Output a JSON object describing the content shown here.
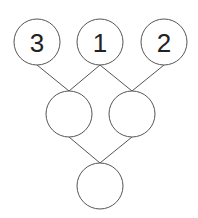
{
  "diagram": {
    "type": "tree",
    "nodes": [
      {
        "id": "top-left",
        "label": "3",
        "cx": 37,
        "cy": 42
      },
      {
        "id": "top-center",
        "label": "1",
        "cx": 100,
        "cy": 42
      },
      {
        "id": "top-right",
        "label": "2",
        "cx": 164,
        "cy": 42
      },
      {
        "id": "mid-left",
        "label": "",
        "cx": 69,
        "cy": 114
      },
      {
        "id": "mid-right",
        "label": "",
        "cx": 132,
        "cy": 114
      },
      {
        "id": "bottom",
        "label": "",
        "cx": 100,
        "cy": 186
      }
    ],
    "edges": [
      [
        "top-left",
        "mid-left"
      ],
      [
        "top-center",
        "mid-left"
      ],
      [
        "top-center",
        "mid-right"
      ],
      [
        "top-right",
        "mid-right"
      ],
      [
        "mid-left",
        "bottom"
      ],
      [
        "mid-right",
        "bottom"
      ]
    ],
    "node_radius": 23
  }
}
